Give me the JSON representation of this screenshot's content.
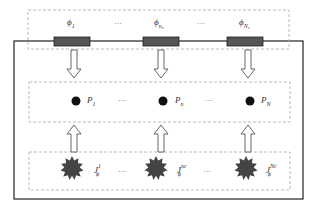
{
  "diagram": {
    "colors": {
      "wire": "#333333",
      "resistor_fill": "#555555",
      "dashed_border": "#aaaaaa",
      "star_fill": "#444444",
      "dot_fill": "#111111",
      "arrow_stroke": "#555555"
    },
    "top_row": {
      "name": "resistor-layer",
      "items": [
        {
          "symbol": "ϕ",
          "sub": "1"
        },
        {
          "symbol": "ϕ",
          "sub": "n₀"
        },
        {
          "symbol": "ϕ",
          "sub": "N₀"
        }
      ],
      "ellipsis": "···"
    },
    "middle_row": {
      "name": "point-layer",
      "items": [
        {
          "symbol": "P",
          "sub": "1"
        },
        {
          "symbol": "P",
          "sub": "n"
        },
        {
          "symbol": "P",
          "sub": "N"
        }
      ],
      "ellipsis": "···"
    },
    "bottom_row": {
      "name": "source-layer",
      "items": [
        {
          "symbol": "J",
          "sub": "ϕ",
          "sup": "1"
        },
        {
          "symbol": "J",
          "sub": "ϕ",
          "sup": "nc"
        },
        {
          "symbol": "J",
          "sub": "ϕ",
          "sup": "Nc"
        }
      ],
      "ellipsis": "···"
    }
  }
}
